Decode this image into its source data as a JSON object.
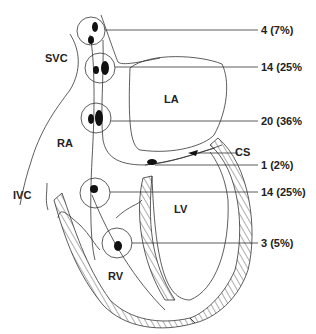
{
  "diagram": {
    "regions": {
      "svc": "SVC",
      "ra": "RA",
      "ivc": "IVC",
      "la": "LA",
      "lv": "LV",
      "rv": "RV",
      "cs": "CS"
    },
    "sites": [
      {
        "id": "site-1",
        "label": "4 (7%)"
      },
      {
        "id": "site-2",
        "label": "14 (25%"
      },
      {
        "id": "site-3",
        "label": "20 (36%"
      },
      {
        "id": "site-4",
        "label": "1 (2%)"
      },
      {
        "id": "site-5",
        "label": "14 (25%)"
      },
      {
        "id": "site-6",
        "label": "3 (5%)"
      }
    ],
    "colors": {
      "line": "#333333",
      "lesion": "#111111",
      "text": "#222222"
    }
  }
}
